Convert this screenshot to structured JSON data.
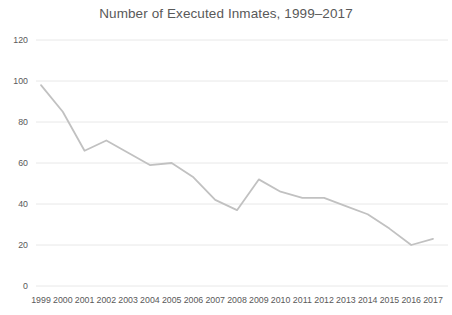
{
  "chart_data": {
    "type": "line",
    "title": "Number of Executed Inmates, 1999–2017",
    "categories": [
      "1999",
      "2000",
      "2001",
      "2002",
      "2003",
      "2004",
      "2005",
      "2006",
      "2007",
      "2008",
      "2009",
      "2010",
      "2011",
      "2012",
      "2013",
      "2014",
      "2015",
      "2016",
      "2017"
    ],
    "values": [
      98,
      85,
      66,
      71,
      65,
      59,
      60,
      53,
      42,
      37,
      52,
      46,
      43,
      43,
      39,
      35,
      28,
      20,
      23
    ],
    "xlabel": "",
    "ylabel": "",
    "ylim": [
      0,
      120
    ],
    "yticks": [
      0,
      20,
      40,
      60,
      80,
      100,
      120
    ],
    "grid": true,
    "legend_position": "none",
    "line_color": "#c1c1c1",
    "grid_color": "#e8e8e8",
    "text_color": "#595959",
    "background_color": "#ffffff"
  }
}
